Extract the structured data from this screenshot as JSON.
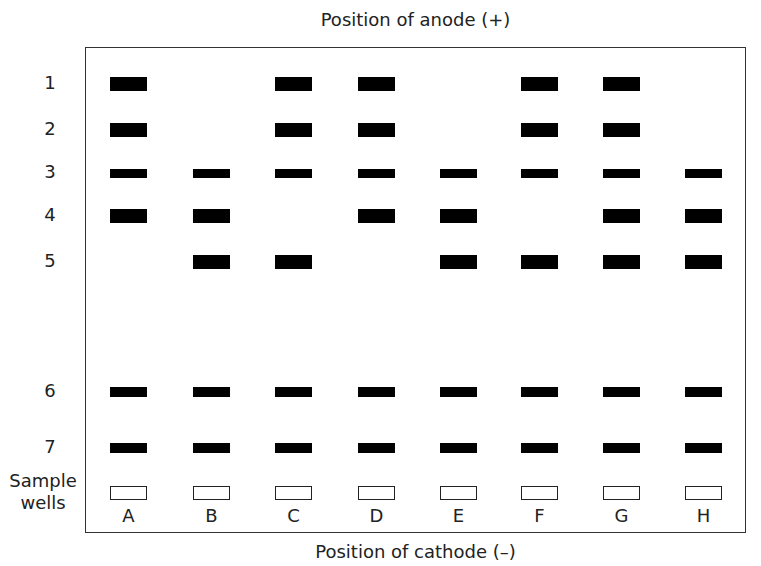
{
  "diagram": {
    "title_top": "Position of anode (+)",
    "title_bottom": "Position of cathode (–)",
    "wells_label_line1": "Sample",
    "wells_label_line2": "wells",
    "row_labels": [
      "1",
      "2",
      "3",
      "4",
      "5",
      "6",
      "7"
    ],
    "lanes": [
      "A",
      "B",
      "C",
      "D",
      "E",
      "F",
      "G",
      "H"
    ],
    "bands_present": {
      "A": [
        1,
        2,
        3,
        4,
        6,
        7
      ],
      "B": [
        3,
        4,
        5,
        6,
        7
      ],
      "C": [
        1,
        2,
        3,
        5,
        6,
        7
      ],
      "D": [
        1,
        2,
        3,
        4,
        6,
        7
      ],
      "E": [
        3,
        4,
        5,
        6,
        7
      ],
      "F": [
        1,
        2,
        3,
        5,
        6,
        7
      ],
      "G": [
        1,
        2,
        3,
        4,
        5,
        6,
        7
      ],
      "H": [
        3,
        4,
        5,
        6,
        7
      ]
    },
    "colors": {
      "band": "#000000",
      "border": "#333333",
      "background": "#ffffff"
    }
  }
}
